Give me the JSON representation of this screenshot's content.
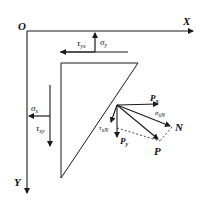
{
  "axes": {
    "origin": "O",
    "x_label": "X",
    "y_label": "Y"
  },
  "top_edge": {
    "sigma_y": {
      "symbol": "σ",
      "sub": "y"
    },
    "tau_yx": {
      "symbol": "τ",
      "sub": "yx"
    }
  },
  "left_edge": {
    "sigma_x": {
      "symbol": "σ",
      "sub": "x"
    },
    "tau_xy": {
      "symbol": "τ",
      "sub": "xy"
    }
  },
  "forces": {
    "px": {
      "symbol": "P",
      "sub": "x"
    },
    "py": {
      "symbol": "P",
      "sub": "y"
    },
    "p": "P",
    "n": "N",
    "sigma_n": {
      "symbol": "σ",
      "sub": "xN"
    },
    "tau_n": {
      "symbol": "τ",
      "sub": "xN"
    }
  },
  "colors": {
    "stroke": "#1a1a1a",
    "background": "#ffffff"
  }
}
